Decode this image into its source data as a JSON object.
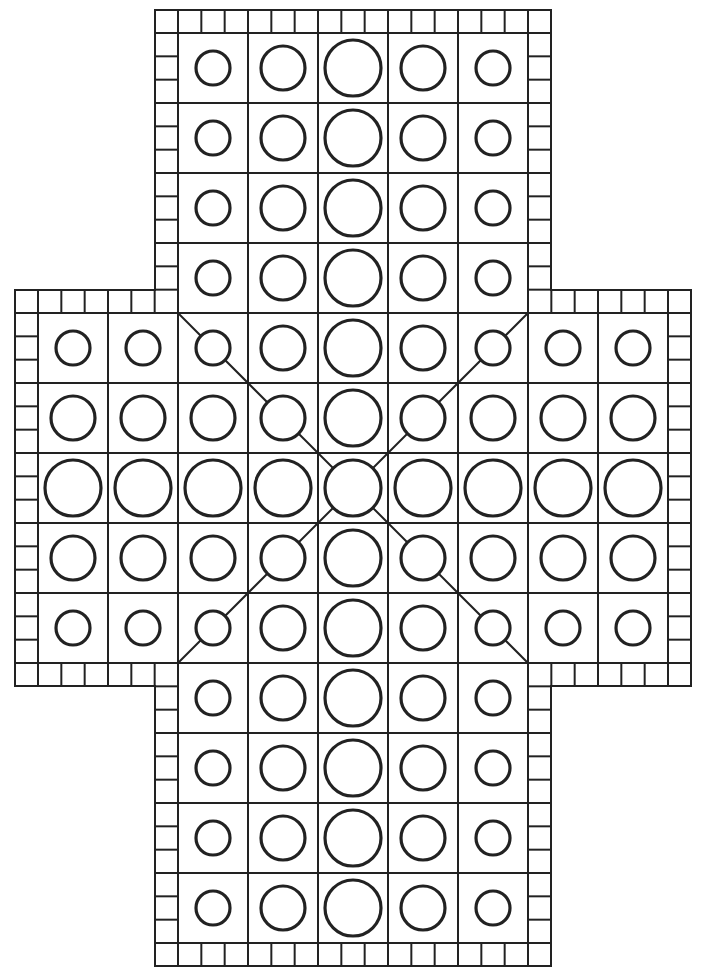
{
  "board": {
    "type": "cross-shaped race board",
    "colors": {
      "line": "#222222",
      "background": "#ffffff"
    },
    "cell_size": 70,
    "origin": {
      "x": 38,
      "y": 33
    },
    "border_width": 23,
    "grid": {
      "cols": 9,
      "rows": 13
    },
    "arms": [
      {
        "name": "top-arm",
        "col_start": 2,
        "col_end": 6,
        "row_start": 0,
        "row_end": 3
      },
      {
        "name": "middle-band",
        "col_start": 0,
        "col_end": 8,
        "row_start": 4,
        "row_end": 8
      },
      {
        "name": "bottom-arm",
        "col_start": 2,
        "col_end": 6,
        "row_start": 9,
        "row_end": 12
      }
    ],
    "circle_radii": {
      "small": 17,
      "medium": 22,
      "large": 28
    },
    "vertical_arm_column_sizes": [
      "small",
      "medium",
      "large",
      "medium",
      "small"
    ],
    "side_arm_row_sizes": [
      "small",
      "medium",
      "large",
      "medium",
      "small"
    ],
    "center_column_size": "large",
    "diagonals": [
      {
        "from": [
          2,
          4
        ],
        "to": [
          7,
          9
        ]
      },
      {
        "from": [
          7,
          4
        ],
        "to": [
          2,
          9
        ]
      }
    ],
    "total_spaces": 85
  }
}
